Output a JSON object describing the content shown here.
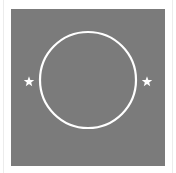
{
  "image": {
    "description": "Gray square panel with a white circle outline and two white stars on either side",
    "background_color": "#ffffff",
    "panel_color": "#7b7b7b",
    "foreground_color": "#ffffff",
    "circle": {
      "cx": 88,
      "cy": 80,
      "r": 48,
      "stroke_width": 2.2
    },
    "stars": [
      {
        "name": "left-star",
        "cx": 29,
        "cy": 81,
        "size": 9
      },
      {
        "name": "right-star",
        "cx": 147,
        "cy": 81,
        "size": 9
      }
    ]
  }
}
